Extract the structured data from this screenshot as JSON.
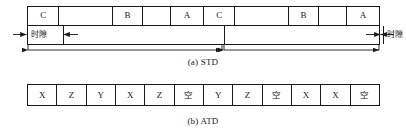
{
  "figure": {
    "std": {
      "caption": "(a) STD",
      "slot_label_left": "时隙",
      "slot_label_right": "时隙",
      "cells": [
        {
          "label": "C",
          "width": 35
        },
        {
          "label": "",
          "width": 60
        },
        {
          "label": "B",
          "width": 33
        },
        {
          "label": "",
          "width": 31
        },
        {
          "label": "A",
          "width": 37
        },
        {
          "label": "C",
          "width": 35
        },
        {
          "label": "",
          "width": 60
        },
        {
          "label": "B",
          "width": 33
        },
        {
          "label": "",
          "width": 31
        },
        {
          "label": "A",
          "width": 36
        }
      ],
      "frames": [
        {
          "name": "frame-1",
          "start": 0,
          "end": 196
        },
        {
          "name": "frame-2",
          "start": 196,
          "end": 353
        }
      ]
    },
    "atd": {
      "caption": "(b) ATD",
      "cells": [
        {
          "label": "X",
          "cjk": false
        },
        {
          "label": "Z",
          "cjk": false
        },
        {
          "label": "Y",
          "cjk": false
        },
        {
          "label": "X",
          "cjk": false
        },
        {
          "label": "Z",
          "cjk": false
        },
        {
          "label": "空",
          "cjk": true
        },
        {
          "label": "Y",
          "cjk": false
        },
        {
          "label": "Z",
          "cjk": false
        },
        {
          "label": "空",
          "cjk": true
        },
        {
          "label": "X",
          "cjk": false
        },
        {
          "label": "X",
          "cjk": false
        },
        {
          "label": "空",
          "cjk": true
        }
      ]
    }
  },
  "colors": {
    "ink": "#1a1a1a",
    "background": "#ffffff"
  }
}
